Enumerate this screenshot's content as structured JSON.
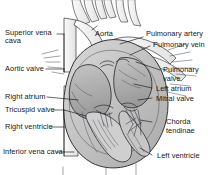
{
  "figure": {
    "background_color": "#ffffff",
    "ink_color": "#15161a",
    "shade_color": "#b3b3b3",
    "width": 224,
    "height": 175
  },
  "labels": {
    "superior_vena_cava_l1": "Superior vena",
    "superior_vena_cava_l2": "cava",
    "aortic_valve": "Aortic valve",
    "right_atrium": "Right atrium",
    "tricuspid_valve": "Tricuspid valve",
    "right_ventricle": "Right ventricle",
    "inferior_vena_cava": "Inferior vena cava",
    "aorta": "Aorta",
    "pulmonary_artery": "Pulmonary artery",
    "pulmonary_vein": "Pulmonary vein",
    "pulmonary_valve_l1": "Pulmonary",
    "pulmonary_valve_l2": "valve",
    "left_atrium": "Left atrium",
    "mitral_valve": "Mitral valve",
    "chorda_tendinae_l1": "Chorda",
    "chorda_tendinae_l2": "tendinae",
    "left_ventricle": "Left ventricle"
  }
}
